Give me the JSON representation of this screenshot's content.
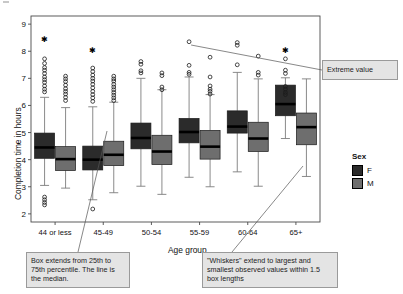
{
  "chart_data": {
    "type": "box",
    "title": "",
    "xlabel": "Age group",
    "ylabel": "Completion time in hours",
    "ylim": [
      1.7,
      9.3
    ],
    "yticks": [
      2,
      3,
      4,
      5,
      6,
      7,
      8,
      9
    ],
    "categories": [
      "44 or less",
      "45-49",
      "50-54",
      "55-59",
      "60-64",
      "65+"
    ],
    "grid": false,
    "legend": {
      "title": "Sex",
      "position": "right",
      "entries": [
        {
          "label": "F",
          "color": "#2b2b2b"
        },
        {
          "label": "M",
          "color": "#6e6e6e"
        }
      ]
    },
    "series": [
      {
        "name": "F",
        "color": "#2b2b2b",
        "boxes": [
          {
            "category": "44 or less",
            "whisker_low": 3.05,
            "q1": 4.05,
            "median": 4.45,
            "q3": 4.98,
            "whisker_high": 6.3,
            "outliers": [
              7.72,
              7.55,
              7.4,
              7.3,
              7.18,
              7.05,
              6.95,
              6.85,
              6.72,
              6.6,
              6.5,
              2.62,
              2.52,
              2.42,
              2.33
            ],
            "extremes": [
              8.42
            ]
          },
          {
            "category": "45-49",
            "whisker_low": 2.52,
            "q1": 3.62,
            "median": 4.0,
            "q3": 4.5,
            "whisker_high": 5.95,
            "outliers": [
              7.38,
              7.25,
              7.12,
              7.0,
              6.9,
              6.78,
              6.65,
              6.52,
              6.4,
              6.28,
              6.15,
              2.18
            ],
            "extremes": [
              8.03
            ]
          },
          {
            "category": "50-54",
            "whisker_low": 3.02,
            "q1": 4.4,
            "median": 4.8,
            "q3": 5.35,
            "whisker_high": 7.0,
            "outliers": [
              7.62,
              7.52,
              7.28,
              7.2
            ],
            "extremes": []
          },
          {
            "category": "55-59",
            "whisker_low": 3.35,
            "q1": 4.62,
            "median": 5.02,
            "q3": 5.52,
            "whisker_high": 7.05,
            "outliers": [
              8.35,
              7.48,
              7.22,
              7.15
            ],
            "extremes": []
          },
          {
            "category": "60-64",
            "whisker_low": 3.55,
            "q1": 4.98,
            "median": 5.22,
            "q3": 5.8,
            "whisker_high": 7.22,
            "outliers": [
              8.32,
              8.22,
              7.5
            ],
            "extremes": []
          },
          {
            "category": "65+",
            "whisker_low": 4.78,
            "q1": 5.62,
            "median": 6.05,
            "q3": 6.75,
            "whisker_high": 7.02,
            "outliers": [
              7.72,
              7.3,
              7.18,
              6.7,
              6.6,
              6.48,
              6.4
            ],
            "extremes": [
              8.02
            ]
          }
        ]
      },
      {
        "name": "M",
        "color": "#6e6e6e",
        "boxes": [
          {
            "category": "44 or less",
            "whisker_low": 2.95,
            "q1": 3.6,
            "median": 4.02,
            "q3": 4.48,
            "whisker_high": 5.92,
            "outliers": [
              7.08,
              6.98,
              6.88,
              6.75,
              6.62,
              6.52,
              6.42,
              6.3,
              6.18
            ],
            "extremes": []
          },
          {
            "category": "45-49",
            "whisker_low": 2.78,
            "q1": 3.78,
            "median": 4.18,
            "q3": 4.68,
            "whisker_high": 6.12,
            "outliers": [
              7.08,
              6.98,
              6.9,
              6.78,
              6.68,
              6.58,
              6.48,
              6.38,
              6.28,
              6.18
            ],
            "extremes": []
          },
          {
            "category": "50-54",
            "whisker_low": 2.72,
            "q1": 3.82,
            "median": 4.3,
            "q3": 4.9,
            "whisker_high": 6.58,
            "outliers": [
              7.2,
              7.1,
              6.68,
              6.58
            ],
            "extremes": []
          },
          {
            "category": "55-59",
            "whisker_low": 3.0,
            "q1": 4.02,
            "median": 4.48,
            "q3": 5.08,
            "whisker_high": 6.4,
            "outliers": [
              7.78,
              7.05,
              6.72,
              6.6,
              6.52,
              6.42
            ],
            "extremes": []
          },
          {
            "category": "60-64",
            "whisker_low": 3.02,
            "q1": 4.3,
            "median": 4.78,
            "q3": 5.38,
            "whisker_high": 6.98,
            "outliers": [
              7.82,
              7.22,
              7.12
            ],
            "extremes": []
          },
          {
            "category": "65+",
            "whisker_low": 3.38,
            "q1": 4.55,
            "median": 5.2,
            "q3": 5.72,
            "whisker_high": 6.98,
            "outliers": [],
            "extremes": []
          }
        ]
      }
    ],
    "annotations": [
      {
        "name": "extreme-value",
        "text": "Extreme value"
      },
      {
        "name": "box-percentile",
        "text": "Box extends from 25th to 75th percentile. The line is the median."
      },
      {
        "name": "whiskers",
        "text": "\"Whiskers\" extend to largest and smallest observed values within 1.5 box lengths"
      }
    ]
  }
}
